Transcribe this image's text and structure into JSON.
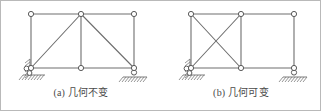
{
  "figure": {
    "width": 321,
    "height": 111,
    "border_color": "#b9b9b9",
    "background": "#ffffff",
    "member_color": "#6e6e6e",
    "node_stroke": "#5a5a5a",
    "node_fill": "#ffffff",
    "hatch_color": "#7a7a7a",
    "caption_color": "#4a4a4a"
  },
  "panels": [
    {
      "id": "a",
      "caption": "(a) 几何不变",
      "caption_label": "geometrically-stable",
      "description": "Two-bay rectangular truss with diagonals from top-middle node to both bottom corners",
      "nodes": [
        {
          "name": "top-left",
          "x": 30,
          "y": 13
        },
        {
          "name": "top-middle",
          "x": 80,
          "y": 13
        },
        {
          "name": "top-right",
          "x": 133,
          "y": 13
        },
        {
          "name": "bottom-left",
          "x": 30,
          "y": 67
        },
        {
          "name": "bottom-middle",
          "x": 80,
          "y": 67
        },
        {
          "name": "bottom-right",
          "x": 133,
          "y": 67
        }
      ],
      "members": [
        {
          "name": "top-chord-left",
          "from": "top-left",
          "to": "top-middle"
        },
        {
          "name": "top-chord-right",
          "from": "top-middle",
          "to": "top-right"
        },
        {
          "name": "bottom-chord-left",
          "from": "bottom-left",
          "to": "bottom-middle"
        },
        {
          "name": "bottom-chord-right",
          "from": "bottom-middle",
          "to": "bottom-right"
        },
        {
          "name": "left-post",
          "from": "top-left",
          "to": "bottom-left"
        },
        {
          "name": "center-post",
          "from": "top-middle",
          "to": "bottom-middle"
        },
        {
          "name": "right-post",
          "from": "top-right",
          "to": "bottom-right"
        },
        {
          "name": "diagonal-left",
          "from": "top-middle",
          "to": "bottom-left"
        },
        {
          "name": "diagonal-right",
          "from": "top-middle",
          "to": "bottom-right"
        }
      ],
      "supports": [
        {
          "name": "pin-support-left",
          "type": "pin-with-wall-and-ground",
          "x": 30,
          "y": 67,
          "wall_x": 20,
          "wall_y": 58,
          "wall_w": 9,
          "wall_h": 16,
          "ground_x": 22,
          "ground_y": 74,
          "ground_w": 22,
          "roller_count": 2
        },
        {
          "name": "roller-support-right",
          "type": "roller-on-ground",
          "x": 133,
          "y": 67,
          "ground_x": 122,
          "ground_y": 76,
          "ground_w": 24,
          "roller_count": 1
        }
      ]
    },
    {
      "id": "b",
      "caption": "(b) 几何可变",
      "caption_label": "geometrically-unstable",
      "description": "Two-bay truss: left bay cross-braced with an X, right bay left as an unbraced rectangle",
      "nodes": [
        {
          "name": "top-left",
          "x": 30,
          "y": 13
        },
        {
          "name": "top-middle",
          "x": 80,
          "y": 13
        },
        {
          "name": "top-right",
          "x": 133,
          "y": 13
        },
        {
          "name": "bottom-left",
          "x": 30,
          "y": 67
        },
        {
          "name": "bottom-middle",
          "x": 80,
          "y": 67
        },
        {
          "name": "bottom-right",
          "x": 133,
          "y": 67
        }
      ],
      "members": [
        {
          "name": "top-chord-left",
          "from": "top-left",
          "to": "top-middle"
        },
        {
          "name": "top-chord-right",
          "from": "top-middle",
          "to": "top-right"
        },
        {
          "name": "bottom-chord-left",
          "from": "bottom-left",
          "to": "bottom-middle"
        },
        {
          "name": "bottom-chord-right",
          "from": "bottom-middle",
          "to": "bottom-right"
        },
        {
          "name": "left-post",
          "from": "top-left",
          "to": "bottom-left"
        },
        {
          "name": "center-post",
          "from": "top-middle",
          "to": "bottom-middle"
        },
        {
          "name": "right-post",
          "from": "top-right",
          "to": "bottom-right"
        },
        {
          "name": "brace-top-left-to-bottom-middle",
          "from": "top-left",
          "to": "bottom-middle"
        },
        {
          "name": "brace-top-middle-to-bottom-left",
          "from": "top-middle",
          "to": "bottom-left"
        }
      ],
      "supports": [
        {
          "name": "pin-support-left",
          "type": "pin-with-wall-and-ground",
          "x": 30,
          "y": 67,
          "wall_x": 20,
          "wall_y": 58,
          "wall_w": 9,
          "wall_h": 16,
          "ground_x": 22,
          "ground_y": 74,
          "ground_w": 22,
          "roller_count": 2
        },
        {
          "name": "roller-support-right",
          "type": "roller-on-ground",
          "x": 133,
          "y": 67,
          "ground_x": 122,
          "ground_y": 76,
          "ground_w": 24,
          "roller_count": 1
        }
      ]
    }
  ]
}
